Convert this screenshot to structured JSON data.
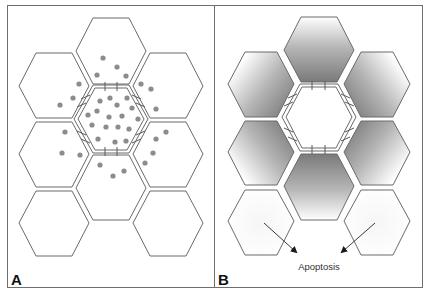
{
  "figure": {
    "panels": [
      {
        "id": "A",
        "label": "A",
        "description": "Hexagonal cell array; central cell with gap junctions, signalling molecules (dots) diffusing to neighbours"
      },
      {
        "id": "B",
        "label": "B",
        "description": "Hexagonal cell array; neighbouring cells shaded by gradient around central cell; outer cells undergo apoptosis",
        "annotation": "Apoptosis"
      }
    ],
    "colors": {
      "outline": "#6a6a6a",
      "dot": "#8c8c8c",
      "gradient_dark": "#7a7a7a",
      "gradient_light": "#ffffff",
      "frame": "#6e6e6e"
    }
  }
}
